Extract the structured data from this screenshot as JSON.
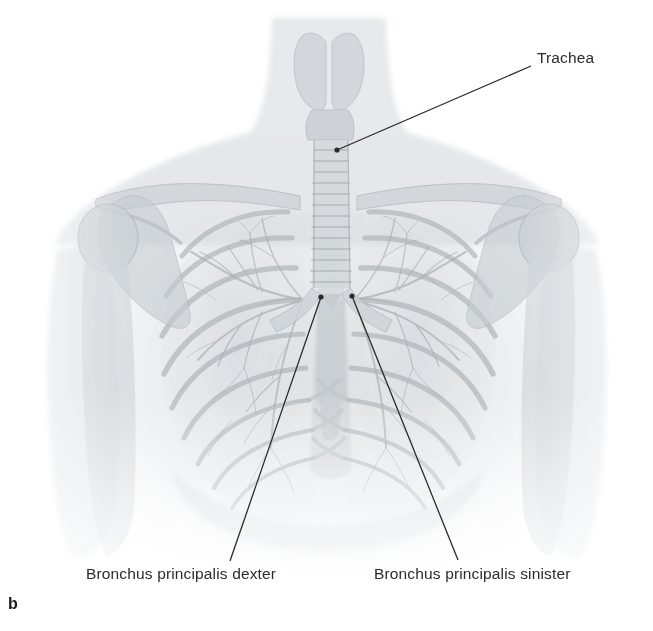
{
  "figure": {
    "panel_letter": "b",
    "background_color": "#ffffff",
    "label_color": "#2b2b2b",
    "leader_line_color": "#2b2b2b",
    "anatomy_tint": "#9aa0a6",
    "width": 653,
    "height": 631
  },
  "labels": [
    {
      "id": "trachea",
      "text": "Trachea",
      "x": 537,
      "y": 50,
      "leader": {
        "x1": 531,
        "y1": 66,
        "x2": 337,
        "y2": 150,
        "dot_x": 337,
        "dot_y": 150
      }
    },
    {
      "id": "bronchus-principalis-dexter",
      "text": "Bronchus principalis  dexter",
      "x": 86,
      "y": 566,
      "leader": {
        "x1": 230,
        "y1": 561,
        "x2": 321,
        "y2": 297,
        "dot_x": 321,
        "dot_y": 297
      }
    },
    {
      "id": "bronchus-principalis-sinister",
      "text": "Bronchus principalis sinister",
      "x": 374,
      "y": 566,
      "leader": {
        "x1": 458,
        "y1": 560,
        "x2": 352,
        "y2": 296,
        "dot_x": 352,
        "dot_y": 296
      }
    }
  ],
  "anatomy_structures": [
    "neck",
    "larynx",
    "thyroid-cartilage",
    "trachea",
    "tracheal-rings",
    "carina",
    "right-main-bronchus",
    "left-main-bronchus",
    "clavicle-left",
    "clavicle-right",
    "scapula-left",
    "scapula-right",
    "humerus-head-left",
    "humerus-head-right",
    "sternum",
    "rib-cage",
    "lung-right",
    "lung-left",
    "pulmonary-vasculature",
    "diaphragm",
    "shoulder-soft-tissue"
  ]
}
